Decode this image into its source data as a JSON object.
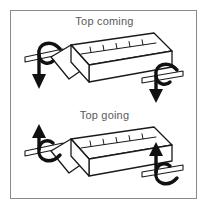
{
  "figure": {
    "type": "technical-illustration",
    "background_color": "#ffffff",
    "frame_color": "#8a8a8a",
    "line_color": "#1a1a1a",
    "label_color": "#5a5a5a"
  },
  "panels": [
    {
      "id": "top-coming",
      "caption": "Top coming",
      "object": "rectangular-block-with-axles",
      "top_face_marking": "graduated-scale",
      "tick_count": 5,
      "rotation": {
        "direction": "top-coming",
        "left_arrow": "curved-arrow-down",
        "right_arrow": "curved-arrow-down",
        "arrow_head": "down"
      }
    },
    {
      "id": "top-going",
      "caption": "Top going",
      "object": "rectangular-block-with-axles",
      "top_face_marking": "graduated-scale",
      "tick_count": 5,
      "rotation": {
        "direction": "top-going",
        "left_arrow": "curved-arrow-up",
        "right_arrow": "curved-arrow-up",
        "arrow_head": "up"
      }
    }
  ]
}
